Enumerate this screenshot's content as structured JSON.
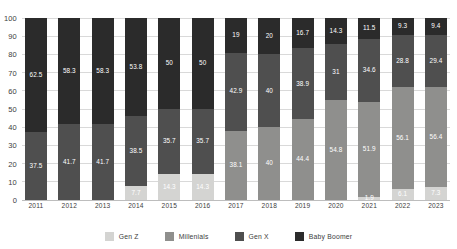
{
  "chart_data": {
    "type": "bar",
    "subtype": "stacked-100-percent",
    "title": "",
    "xlabel": "",
    "ylabel": "",
    "ylim": [
      0,
      100
    ],
    "ytick_step": 10,
    "grid": true,
    "legend_position": "bottom-center",
    "categories": [
      "2011",
      "2012",
      "2013",
      "2014",
      "2015",
      "2016",
      "2017",
      "2018",
      "2019",
      "2020",
      "2021",
      "2022",
      "2023"
    ],
    "yticks": [
      "100",
      "90",
      "80",
      "70",
      "60",
      "50",
      "40",
      "30",
      "20",
      "10",
      "0"
    ],
    "series": [
      {
        "name": "Gen Z",
        "color": "#d4d4d2",
        "values": [
          null,
          null,
          null,
          7.7,
          14.3,
          14.3,
          null,
          null,
          null,
          null,
          1.9,
          6.1,
          7.3
        ],
        "labels": [
          "",
          "",
          "",
          "7.7",
          "14.3",
          "14.3",
          "",
          "",
          "",
          "",
          "1.9",
          "6.1",
          "7.3"
        ]
      },
      {
        "name": "Millenials",
        "color": "#8f8f8d",
        "values": [
          null,
          null,
          null,
          null,
          null,
          null,
          38.1,
          40,
          44.4,
          54.8,
          51.9,
          56.1,
          56.4
        ],
        "labels": [
          "",
          "",
          "",
          "",
          "",
          "",
          "38.1",
          "40",
          "44.4",
          "54.8",
          "51.9",
          "56.1",
          "56.4"
        ]
      },
      {
        "name": "Gen X",
        "color": "#4f4f4f",
        "values": [
          37.5,
          41.7,
          41.7,
          38.5,
          35.7,
          35.7,
          42.9,
          40,
          38.9,
          31,
          34.6,
          28.8,
          29.4
        ],
        "labels": [
          "37.5",
          "41.7",
          "41.7",
          "38.5",
          "35.7",
          "35.7",
          "42.9",
          "40",
          "38.9",
          "31",
          "34.6",
          "28.8",
          "29.4"
        ]
      },
      {
        "name": "Baby Boomer",
        "color": "#2b2b2b",
        "values": [
          62.5,
          58.3,
          58.3,
          53.8,
          50,
          50,
          19,
          20,
          16.7,
          14.3,
          11.5,
          9.3,
          9.4
        ],
        "labels": [
          "62.5",
          "58.3",
          "58.3",
          "53.8",
          "50",
          "50",
          "19",
          "20",
          "16.7",
          "14.3",
          "11.5",
          "9.3",
          "9.4"
        ]
      }
    ]
  },
  "legend": {
    "items": [
      {
        "label": "Gen Z",
        "color": "#d4d4d2"
      },
      {
        "label": "Millenials",
        "color": "#8f8f8d"
      },
      {
        "label": "Gen X",
        "color": "#4f4f4f"
      },
      {
        "label": "Baby Boomer",
        "color": "#2b2b2b"
      }
    ]
  }
}
